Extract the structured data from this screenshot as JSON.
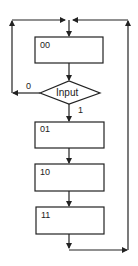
{
  "diagram": {
    "type": "flowchart",
    "states": [
      {
        "id": "s00",
        "label": "00"
      },
      {
        "id": "s01",
        "label": "01"
      },
      {
        "id": "s10",
        "label": "10"
      },
      {
        "id": "s11",
        "label": "11"
      }
    ],
    "decision": {
      "label": "Input",
      "branch_false": "0",
      "branch_true": "1"
    },
    "stroke_color": "#222222"
  }
}
